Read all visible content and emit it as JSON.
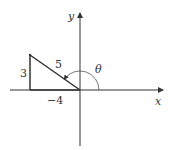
{
  "diagram": {
    "axes": {
      "x_label": "x",
      "y_label": "y"
    },
    "triangle": {
      "vertical_side": "3",
      "hypotenuse": "5",
      "horizontal_side": "−4"
    },
    "angle_label": "θ",
    "colors": {
      "line": "#333333",
      "arc": "#555555",
      "background": "#ffffff"
    }
  }
}
